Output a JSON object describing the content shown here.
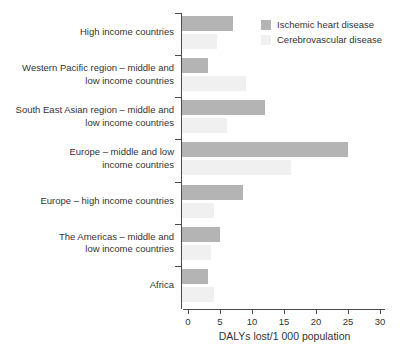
{
  "figure": {
    "background": "#ffffff",
    "text_color": "#333333",
    "axis_color": "#4a4a4a"
  },
  "chart_data": {
    "type": "bar",
    "orientation": "horizontal",
    "title": "",
    "xlabel": "DALYs lost/1 000 population",
    "ylabel": "",
    "xlim": [
      0,
      30
    ],
    "x_ticks": [
      "0",
      "5",
      "10",
      "15",
      "20",
      "25",
      "30"
    ],
    "grid": false,
    "legend_position": "top-right",
    "categories": [
      "High income countries",
      "Western Pacific region – middle and low income countries",
      "South East Asian region – middle and low income countries",
      "Europe – middle and low income countries",
      "Europe – high income countries",
      "The Americas – middle and low income countries",
      "Africa"
    ],
    "category_lines": [
      [
        "High income countries"
      ],
      [
        "Western Pacific region – middle and",
        "low income countries"
      ],
      [
        "South East Asian region – middle and",
        "low income countries"
      ],
      [
        "Europe – middle and low",
        "income countries"
      ],
      [
        "Europe – high income countries"
      ],
      [
        "The Americas – middle and",
        "low income countries"
      ],
      [
        "Africa"
      ]
    ],
    "series": [
      {
        "name": "Ischemic heart disease",
        "color": "#b4b4b4",
        "values": [
          8,
          4,
          13,
          26,
          9.5,
          6,
          4
        ]
      },
      {
        "name": "Cerebrovascular disease",
        "color": "#f0f0f0",
        "values": [
          5.5,
          10,
          7,
          17,
          5,
          4.5,
          5
        ]
      }
    ]
  }
}
